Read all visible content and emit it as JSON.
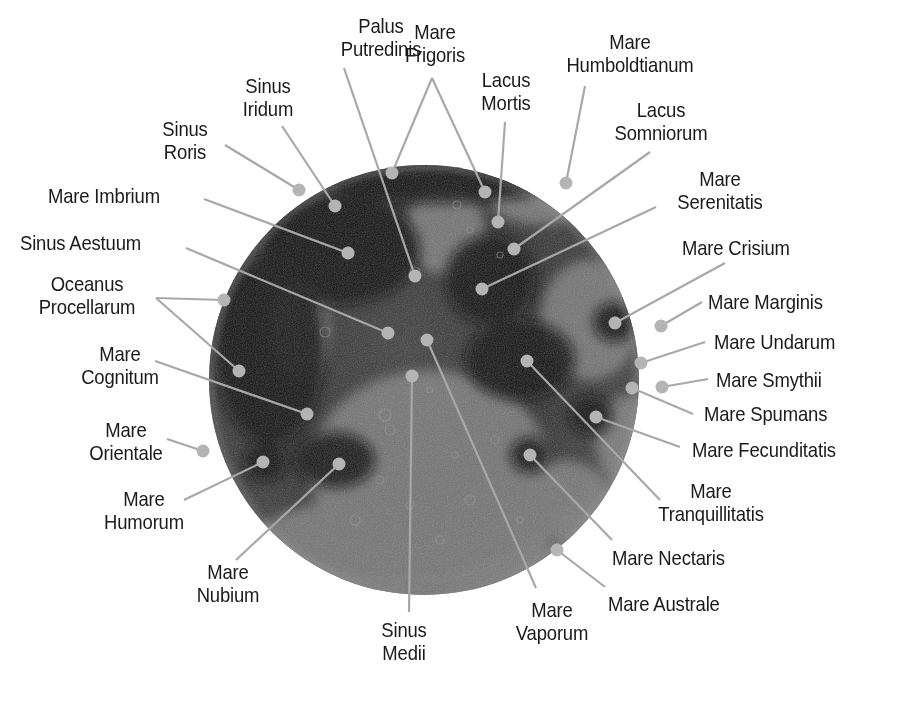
{
  "diagram": {
    "colors": {
      "background": "#ffffff",
      "label_text": "#1a1a1a",
      "leader_line": "#a8a8a8",
      "marker_dot": "#b4b4b4",
      "moon_dark": "#141414",
      "moon_light": "#8a8a8a"
    },
    "moon": {
      "cx": 424,
      "cy": 380,
      "r": 215
    },
    "labels": [
      {
        "id": "palus-putredinis",
        "text": "Palus\nPutredinis",
        "x": 322,
        "y": 14,
        "w": 118,
        "align": "c",
        "dots": [
          [
            415,
            276
          ]
        ],
        "line_start": [
          [
            344,
            68
          ]
        ]
      },
      {
        "id": "mare-frigoris",
        "text": "Mare\nFrigoris",
        "x": 390,
        "y": 20,
        "w": 90,
        "align": "c",
        "dots": [
          [
            392,
            173
          ],
          [
            485,
            192
          ]
        ],
        "line_start": [
          [
            432,
            78
          ],
          [
            432,
            78
          ]
        ]
      },
      {
        "id": "sinus-iridum",
        "text": "Sinus\nIridum",
        "x": 230,
        "y": 74,
        "w": 76,
        "align": "c",
        "dots": [
          [
            335,
            206
          ]
        ],
        "line_start": [
          [
            282,
            126
          ]
        ]
      },
      {
        "id": "lacus-mortis",
        "text": "Lacus\nMortis",
        "x": 468,
        "y": 68,
        "w": 76,
        "align": "c",
        "dots": [
          [
            498,
            222
          ]
        ],
        "line_start": [
          [
            505,
            122
          ]
        ]
      },
      {
        "id": "mare-humboldtianum",
        "text": "Mare\nHumboldtianum",
        "x": 550,
        "y": 30,
        "w": 160,
        "align": "c",
        "dots": [
          [
            566,
            183
          ]
        ],
        "line_start": [
          [
            585,
            86
          ]
        ]
      },
      {
        "id": "sinus-roris",
        "text": "Sinus\nRoris",
        "x": 150,
        "y": 117,
        "w": 70,
        "align": "c",
        "dots": [
          [
            299,
            190
          ]
        ],
        "line_start": [
          [
            225,
            145
          ]
        ]
      },
      {
        "id": "lacus-somniorum",
        "text": "Lacus\nSomniorum",
        "x": 596,
        "y": 98,
        "w": 130,
        "align": "c",
        "dots": [
          [
            514,
            249
          ]
        ],
        "line_start": [
          [
            650,
            152
          ]
        ]
      },
      {
        "id": "mare-imbrium",
        "text": "Mare Imbrium",
        "x": 48,
        "y": 184,
        "w": 160,
        "align": "l",
        "dots": [
          [
            348,
            253
          ]
        ],
        "line_start": [
          [
            204,
            199
          ]
        ]
      },
      {
        "id": "mare-serenitatis",
        "text": "Mare\nSerenitatis",
        "x": 660,
        "y": 167,
        "w": 120,
        "align": "c",
        "dots": [
          [
            482,
            289
          ]
        ],
        "line_start": [
          [
            656,
            207
          ]
        ]
      },
      {
        "id": "sinus-aestuum",
        "text": "Sinus Aestuum",
        "x": 20,
        "y": 231,
        "w": 180,
        "align": "l",
        "dots": [
          [
            388,
            333
          ]
        ],
        "line_start": [
          [
            186,
            248
          ]
        ]
      },
      {
        "id": "mare-crisium",
        "text": "Mare Crisium",
        "x": 682,
        "y": 236,
        "w": 150,
        "align": "l",
        "dots": [
          [
            615,
            323
          ]
        ],
        "line_start": [
          [
            725,
            263
          ]
        ]
      },
      {
        "id": "oceanus-procellarum",
        "text": "Oceanus\nProcellarum",
        "x": 14,
        "y": 272,
        "w": 146,
        "align": "c",
        "dots": [
          [
            224,
            300
          ],
          [
            239,
            371
          ]
        ],
        "line_start": [
          [
            156,
            298
          ],
          [
            156,
            298
          ]
        ]
      },
      {
        "id": "mare-marginis",
        "text": "Mare Marginis",
        "x": 708,
        "y": 290,
        "w": 160,
        "align": "l",
        "dots": [
          [
            661,
            326
          ]
        ],
        "line_start": [
          [
            702,
            302
          ]
        ]
      },
      {
        "id": "mare-undarum",
        "text": "Mare Undarum",
        "x": 714,
        "y": 330,
        "w": 170,
        "align": "l",
        "dots": [
          [
            641,
            363
          ]
        ],
        "line_start": [
          [
            705,
            342
          ]
        ]
      },
      {
        "id": "mare-cognitum",
        "text": "Mare\nCognitum",
        "x": 66,
        "y": 342,
        "w": 108,
        "align": "c",
        "dots": [
          [
            307,
            414
          ]
        ],
        "line_start": [
          [
            155,
            361
          ]
        ]
      },
      {
        "id": "mare-smythii",
        "text": "Mare Smythii",
        "x": 716,
        "y": 368,
        "w": 160,
        "align": "l",
        "dots": [
          [
            662,
            387
          ]
        ],
        "line_start": [
          [
            708,
            379
          ]
        ]
      },
      {
        "id": "mare-spumans",
        "text": "Mare Spumans",
        "x": 704,
        "y": 402,
        "w": 170,
        "align": "l",
        "dots": [
          [
            632,
            388
          ]
        ],
        "line_start": [
          [
            693,
            414
          ]
        ]
      },
      {
        "id": "mare-fecunditatis",
        "text": "Mare Fecunditatis",
        "x": 692,
        "y": 438,
        "w": 200,
        "align": "l",
        "dots": [
          [
            596,
            417
          ]
        ],
        "line_start": [
          [
            680,
            447
          ]
        ]
      },
      {
        "id": "mare-orientale",
        "text": "Mare\nOrientale",
        "x": 76,
        "y": 418,
        "w": 100,
        "align": "c",
        "dots": [
          [
            203,
            451
          ]
        ],
        "line_start": [
          [
            167,
            439
          ]
        ]
      },
      {
        "id": "mare-humorum",
        "text": "Mare\nHumorum",
        "x": 90,
        "y": 487,
        "w": 108,
        "align": "c",
        "dots": [
          [
            263,
            462
          ]
        ],
        "line_start": [
          [
            184,
            500
          ]
        ]
      },
      {
        "id": "mare-tranquillitatis",
        "text": "Mare\nTranquillitatis",
        "x": 636,
        "y": 479,
        "w": 150,
        "align": "c",
        "dots": [
          [
            527,
            361
          ]
        ],
        "line_start": [
          [
            660,
            500
          ]
        ]
      },
      {
        "id": "mare-nectaris",
        "text": "Mare Nectaris",
        "x": 612,
        "y": 546,
        "w": 160,
        "align": "l",
        "dots": [
          [
            530,
            455
          ]
        ],
        "line_start": [
          [
            612,
            540
          ]
        ]
      },
      {
        "id": "mare-nubium",
        "text": "Mare\nNubium",
        "x": 180,
        "y": 560,
        "w": 96,
        "align": "c",
        "dots": [
          [
            339,
            464
          ]
        ],
        "line_start": [
          [
            236,
            560
          ]
        ]
      },
      {
        "id": "mare-australe",
        "text": "Mare Australe",
        "x": 608,
        "y": 592,
        "w": 160,
        "align": "l",
        "dots": [
          [
            557,
            550
          ]
        ],
        "line_start": [
          [
            605,
            587
          ]
        ]
      },
      {
        "id": "mare-vaporum",
        "text": "Mare\nVaporum",
        "x": 502,
        "y": 598,
        "w": 100,
        "align": "c",
        "dots": [
          [
            427,
            340
          ]
        ],
        "line_start": [
          [
            536,
            588
          ]
        ]
      },
      {
        "id": "sinus-medii",
        "text": "Sinus\nMedii",
        "x": 364,
        "y": 618,
        "w": 80,
        "align": "c",
        "dots": [
          [
            412,
            376
          ]
        ],
        "line_start": [
          [
            409,
            612
          ]
        ]
      }
    ]
  }
}
